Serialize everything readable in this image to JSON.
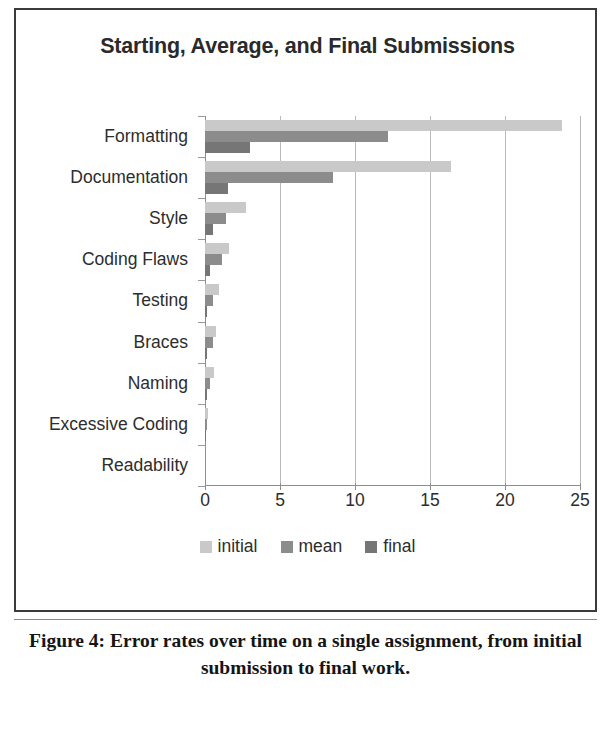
{
  "figure": {
    "caption": "Figure 4: Error rates over time on a single assignment, from initial submission to final work."
  },
  "chart_data": {
    "type": "bar",
    "orientation": "horizontal",
    "title": "Starting, Average, and Final Submissions",
    "xlabel": "",
    "ylabel": "",
    "xlim": [
      0,
      25
    ],
    "xticks": [
      0,
      5,
      10,
      15,
      20,
      25
    ],
    "xtick_labels": [
      "0",
      "5",
      "10",
      "15",
      "20",
      "25"
    ],
    "grid": true,
    "legend_position": "bottom",
    "categories": [
      "Formatting",
      "Documentation",
      "Style",
      "Coding Flaws",
      "Testing",
      "Braces",
      "Naming",
      "Excessive Coding",
      "Readability"
    ],
    "series": [
      {
        "name": "initial",
        "color": "#c9c9c9",
        "values": [
          23.8,
          16.4,
          2.7,
          1.6,
          0.9,
          0.7,
          0.6,
          0.2,
          0.0
        ]
      },
      {
        "name": "mean",
        "color": "#8c8c8c",
        "values": [
          12.2,
          8.5,
          1.4,
          1.1,
          0.5,
          0.5,
          0.35,
          0.15,
          0.0
        ]
      },
      {
        "name": "final",
        "color": "#767676",
        "values": [
          3.0,
          1.5,
          0.5,
          0.3,
          0.15,
          0.1,
          0.1,
          0.05,
          0.0
        ]
      }
    ]
  }
}
